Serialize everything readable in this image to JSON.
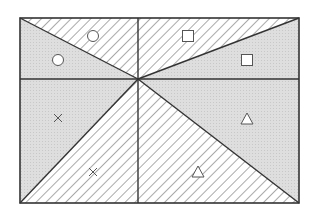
{
  "diagram": {
    "frame": {
      "x1": 20,
      "y1": 18,
      "x2": 299,
      "y2": 203
    },
    "center": {
      "x": 138,
      "y": 79
    },
    "colors": {
      "line": "#333333",
      "gray_fill": "#dcdcdc",
      "hatch": "#555555",
      "background": "#ffffff"
    },
    "regions": [
      {
        "id": "top-left-lower",
        "fill": "gray",
        "marker": "circle",
        "mx": 58,
        "my": 60
      },
      {
        "id": "top-left-upper",
        "fill": "hatch",
        "marker": "circle",
        "mx": 93,
        "my": 36
      },
      {
        "id": "top-right-upper",
        "fill": "hatch",
        "marker": "square",
        "mx": 188,
        "my": 36
      },
      {
        "id": "top-right-lower",
        "fill": "gray",
        "marker": "square",
        "mx": 247,
        "my": 60
      },
      {
        "id": "bottom-left-upper",
        "fill": "gray",
        "marker": "cross",
        "mx": 58,
        "my": 118
      },
      {
        "id": "bottom-left-lower",
        "fill": "hatch",
        "marker": "cross",
        "mx": 93,
        "my": 172
      },
      {
        "id": "bottom-right-upper",
        "fill": "gray",
        "marker": "triangle",
        "mx": 247,
        "my": 119
      },
      {
        "id": "bottom-right-lower",
        "fill": "hatch",
        "marker": "triangle",
        "mx": 198,
        "my": 172
      }
    ]
  }
}
